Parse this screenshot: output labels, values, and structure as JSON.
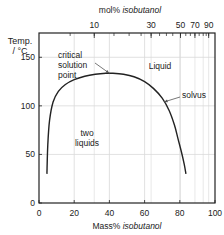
{
  "chart_data": {
    "type": "line",
    "title": "",
    "xlabel": "Mass% isobutanol",
    "xlabel_parts": [
      "Mass% ",
      "isobutanol"
    ],
    "ylabel": "Temp. / °C",
    "ylabel_lines": [
      "Temp.",
      "/ °C"
    ],
    "top_xlabel": "mol% isobutanol",
    "top_xlabel_parts": [
      "mol% ",
      "isobutanol"
    ],
    "xlim": [
      0,
      100
    ],
    "ylim": [
      0,
      175
    ],
    "x_ticks": [
      0,
      20,
      40,
      60,
      80,
      100
    ],
    "x_tick_labels": [
      "0",
      "20",
      "40",
      "60",
      "80",
      "100"
    ],
    "y_ticks": [
      0,
      50,
      100,
      150
    ],
    "y_tick_labels": [
      "0",
      "50",
      "100",
      "150"
    ],
    "top_ticks_mass": [
      31.4,
      63.7,
      80.4,
      88.6,
      93.3,
      96.4
    ],
    "top_tick_labels": [
      {
        "label": "10",
        "mass": 31.4
      },
      {
        "label": "30",
        "mass": 63.7
      },
      {
        "label": "50",
        "mass": 80.4
      },
      {
        "label": "70",
        "mass": 88.6
      },
      {
        "label": "90",
        "mass": 96.4
      }
    ],
    "top_minor_ticks_mass": [
      17.7,
      31.4,
      42.6,
      51.2,
      58.0,
      63.7,
      68.5,
      72.4,
      76.0,
      80.4,
      83.4,
      86.0,
      88.6,
      91.0,
      93.3,
      95.0,
      96.4
    ],
    "grid": true,
    "series": [
      {
        "name": "solvus",
        "x": [
          4.5,
          5.0,
          6.0,
          8.0,
          11.0,
          15.0,
          20.0,
          26.0,
          32.0,
          38.0,
          42.0,
          48.0,
          54.0,
          60.0,
          65.0,
          70.0,
          74.0,
          77.0,
          79.0,
          81.0,
          82.5,
          83.5
        ],
        "y": [
          30,
          60,
          85,
          104,
          115,
          122,
          127,
          130.5,
          132.5,
          133.5,
          133.5,
          132.5,
          130,
          125,
          118,
          108,
          95,
          80,
          66,
          52,
          40,
          30
        ]
      }
    ],
    "annotations": [
      {
        "text": "critical solution point",
        "lines": [
          "critical",
          "solution",
          "point"
        ],
        "x": 12,
        "y": 150,
        "arrow_to": [
          40,
          133.5
        ]
      },
      {
        "text": "solvus",
        "x": 82,
        "y": 108,
        "arrow_to": [
          71,
          104
        ]
      },
      {
        "text": "Liquid",
        "x": 67,
        "y": 150
      },
      {
        "text": "two liquids",
        "lines": [
          "two",
          "liquids"
        ],
        "x": 28,
        "y": 85
      }
    ]
  },
  "colors": {
    "axis": "#222222",
    "grid": "#d9d9d9",
    "curve": "#222222",
    "text": "#222222"
  }
}
